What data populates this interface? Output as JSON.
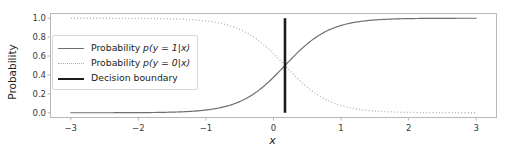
{
  "chart_data": {
    "type": "line",
    "title": "",
    "xlabel": "x",
    "ylabel": "Probability",
    "xlim": [
      -3.3,
      3.3
    ],
    "ylim": [
      -0.05,
      1.05
    ],
    "grid": false,
    "legend_position": "upper left",
    "xticks": [
      -3,
      -2,
      -1,
      0,
      1,
      2,
      3
    ],
    "xtick_labels": [
      "−3",
      "−2",
      "−1",
      "0",
      "1",
      "2",
      "3"
    ],
    "yticks": [
      0.0,
      0.2,
      0.4,
      0.6,
      0.8,
      1.0
    ],
    "ytick_labels": [
      "0.0",
      "0.2",
      "0.4",
      "0.6",
      "0.8",
      "1.0"
    ],
    "series": [
      {
        "name": "Probability p(y = 1|x)",
        "style": "solid",
        "color": "#6f6f6f",
        "linewidth": 1.2,
        "formula": "sigmoid(3*(x-0.17))",
        "x": [
          -3.0,
          -2.75,
          -2.5,
          -2.25,
          -2.0,
          -1.75,
          -1.5,
          -1.25,
          -1.0,
          -0.75,
          -0.5,
          -0.25,
          0.0,
          0.17,
          0.25,
          0.5,
          0.75,
          1.0,
          1.25,
          1.5,
          1.75,
          2.0,
          2.25,
          2.5,
          2.75,
          3.0
        ],
        "y": [
          0.0001,
          0.0002,
          0.0005,
          0.001,
          0.002,
          0.004,
          0.009,
          0.019,
          0.039,
          0.078,
          0.148,
          0.263,
          0.425,
          0.5,
          0.559,
          0.725,
          0.846,
          0.922,
          0.962,
          0.982,
          0.992,
          0.996,
          0.998,
          0.999,
          0.9996,
          0.9998
        ]
      },
      {
        "name": "Probability p(y = 0|x)",
        "style": "dotted",
        "color": "#b0b0b0",
        "linewidth": 1.3,
        "formula": "1 - sigmoid(3*(x-0.17))",
        "x": [
          -3.0,
          -2.75,
          -2.5,
          -2.25,
          -2.0,
          -1.75,
          -1.5,
          -1.25,
          -1.0,
          -0.75,
          -0.5,
          -0.25,
          0.0,
          0.17,
          0.25,
          0.5,
          0.75,
          1.0,
          1.25,
          1.5,
          1.75,
          2.0,
          2.25,
          2.5,
          2.75,
          3.0
        ],
        "y": [
          0.9999,
          0.9998,
          0.9995,
          0.999,
          0.998,
          0.996,
          0.991,
          0.981,
          0.961,
          0.922,
          0.852,
          0.737,
          0.575,
          0.5,
          0.441,
          0.275,
          0.154,
          0.078,
          0.038,
          0.018,
          0.008,
          0.004,
          0.002,
          0.001,
          0.0004,
          0.0002
        ]
      },
      {
        "name": "Decision boundary",
        "style": "vline",
        "color": "#1c1c1c",
        "linewidth": 2.6,
        "x_value": 0.17,
        "y_range": [
          0.0,
          1.0
        ]
      }
    ],
    "legend_entries": [
      {
        "label_prefix": "Probability ",
        "label_math": "p(y = 1|x)",
        "style": "solid-thin"
      },
      {
        "label_prefix": "Probability ",
        "label_math": "p(y = 0|x)",
        "style": "dotted"
      },
      {
        "label_prefix": "Decision boundary",
        "label_math": "",
        "style": "solid-thick"
      }
    ],
    "colors": {
      "curve_p1": "#6f6f6f",
      "curve_p0": "#b0b0b0",
      "boundary": "#1c1c1c",
      "spine": "#b8b8b8",
      "background": "#ffffff",
      "text": "#222222"
    }
  }
}
